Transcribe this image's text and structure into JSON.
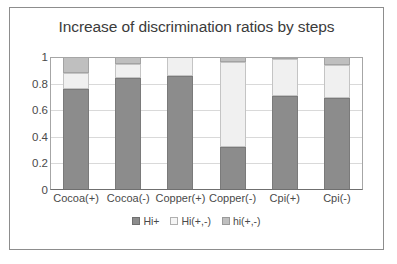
{
  "chart_data": {
    "type": "bar",
    "subtype": "stacked-bar-100",
    "title": "Increase of discrimination ratios by steps",
    "xlabel": "",
    "ylabel": "",
    "ylim": [
      0,
      1
    ],
    "yticks": [
      "0",
      "0.2",
      "0.4",
      "0.6",
      "0.8",
      "1"
    ],
    "ytick_values": [
      0,
      0.2,
      0.4,
      0.6,
      0.8,
      1
    ],
    "grid": true,
    "legend_position": "bottom",
    "categories": [
      "Cocoa(+)",
      "Cocoa(-)",
      "Copper(+)",
      "Copper(-)",
      "Cpi(+)",
      "Cpi(-)"
    ],
    "series": [
      {
        "name": "Hi+",
        "color": "#8c8c8c",
        "values": [
          0.76,
          0.84,
          0.855,
          0.32,
          0.71,
          0.69
        ]
      },
      {
        "name": "Hi(+,-)",
        "color": "#f0f0f0",
        "values": [
          0.12,
          0.11,
          0.145,
          0.64,
          0.275,
          0.25
        ]
      },
      {
        "name": "hi(+,-)",
        "color": "#bfbfbf",
        "values": [
          0.12,
          0.05,
          0.0,
          0.04,
          0.015,
          0.06
        ]
      }
    ]
  }
}
